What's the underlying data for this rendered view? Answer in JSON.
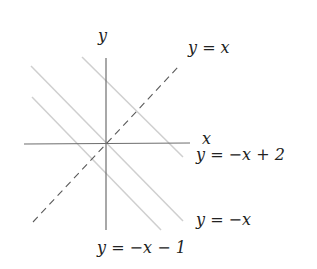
{
  "diagram": {
    "axes": {
      "x_label": "x",
      "y_label": "y"
    },
    "lines": [
      {
        "id": "y_eq_x",
        "label": "y = x",
        "style": "dashed",
        "color": "#555555"
      },
      {
        "id": "y_eq_neg_x_plus_2",
        "label": "y = −x + 2",
        "style": "solid",
        "color": "#c8c8c8"
      },
      {
        "id": "y_eq_neg_x",
        "label": "y = −x",
        "style": "solid",
        "color": "#c8c8c8"
      },
      {
        "id": "y_eq_neg_x_minus_1",
        "label": "y = −x − 1",
        "style": "solid",
        "color": "#c8c8c8"
      }
    ],
    "colors": {
      "axis": "#666666",
      "dashed": "#555555",
      "gray_lines": "#c8c8c8",
      "text": "#222222"
    }
  }
}
